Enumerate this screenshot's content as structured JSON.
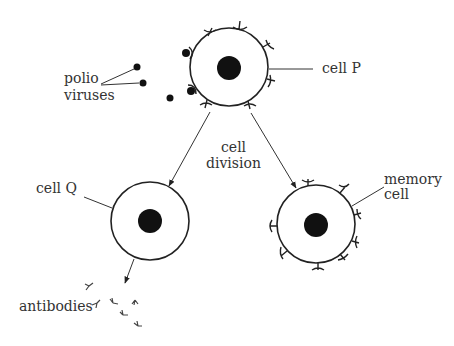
{
  "diagram": {
    "type": "biology-immune-response",
    "labels": {
      "polio_line1": "polio",
      "polio_line2": "viruses",
      "cell_p": "cell P",
      "division_line1": "cell",
      "division_line2": "division",
      "cell_q": "cell Q",
      "memory_line1": "memory",
      "memory_line2": "cell",
      "antibodies": "antibodies"
    },
    "colors": {
      "ink": "#222222",
      "text": "#333333",
      "background": "#ffffff"
    },
    "nodes": [
      {
        "id": "cell-p",
        "label": "cell P",
        "cx": 229,
        "cy": 67,
        "r": 39
      },
      {
        "id": "cell-q",
        "label": "cell Q",
        "cx": 150,
        "cy": 221,
        "r": 39
      },
      {
        "id": "memory-cell",
        "label": "memory cell",
        "cx": 316,
        "cy": 224,
        "r": 39
      }
    ],
    "edges": [
      {
        "from": "cell-p",
        "to": "cell-q",
        "label": "cell division"
      },
      {
        "from": "cell-p",
        "to": "memory-cell",
        "label": "cell division"
      },
      {
        "from": "cell-q",
        "to": "antibodies",
        "label": ""
      }
    ]
  }
}
